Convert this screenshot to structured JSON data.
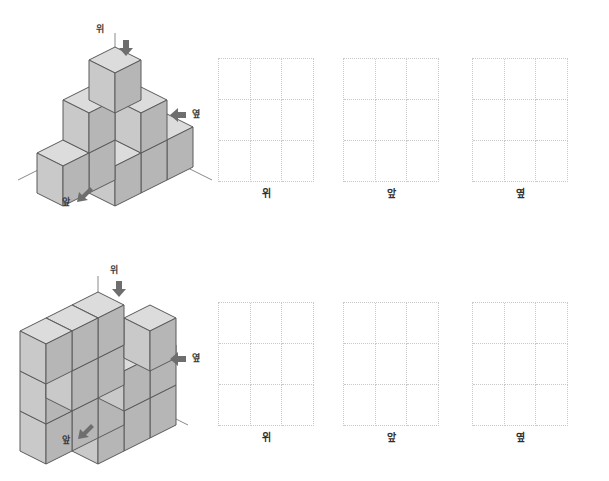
{
  "page": {
    "background_color": "#ffffff"
  },
  "style": {
    "cube_top_face": "#dcdcdc",
    "cube_left_face": "#c8c8c8",
    "cube_right_face": "#b4b4b4",
    "cube_edge": "#5a5a5a",
    "arrow_color": "#6e6e6e",
    "axis_line": "#8a8a8a",
    "grid_line": "#c9c9c9",
    "label_color": "#2f2f2f"
  },
  "directions": {
    "top": "위",
    "front": "앞",
    "side": "옆"
  },
  "problems": [
    {
      "id": "problem-1",
      "figure": {
        "name": "staircase-pyramid-solid",
        "cube_count": 8,
        "levels": 3,
        "arrows": [
          {
            "name": "top-arrow",
            "label": "위",
            "points": "down"
          },
          {
            "name": "side-arrow",
            "label": "옆",
            "points": "left"
          },
          {
            "name": "front-arrow",
            "label": "앞",
            "points": "down-left"
          }
        ]
      },
      "grids": [
        {
          "name": "top-view-grid",
          "caption": "위",
          "rows": 3,
          "cols": 3
        },
        {
          "name": "front-view-grid",
          "caption": "앞",
          "rows": 3,
          "cols": 3
        },
        {
          "name": "side-view-grid",
          "caption": "옆",
          "rows": 3,
          "cols": 3
        }
      ]
    },
    {
      "id": "problem-2",
      "figure": {
        "name": "stepped-block-solid",
        "cube_count": 14,
        "levels": 3,
        "arrows": [
          {
            "name": "top-arrow",
            "label": "위",
            "points": "down"
          },
          {
            "name": "side-arrow",
            "label": "옆",
            "points": "left"
          },
          {
            "name": "front-arrow",
            "label": "앞",
            "points": "down-left"
          }
        ]
      },
      "grids": [
        {
          "name": "top-view-grid",
          "caption": "위",
          "rows": 3,
          "cols": 3
        },
        {
          "name": "front-view-grid",
          "caption": "앞",
          "rows": 3,
          "cols": 3
        },
        {
          "name": "side-view-grid",
          "caption": "옆",
          "rows": 3,
          "cols": 3
        }
      ]
    }
  ]
}
